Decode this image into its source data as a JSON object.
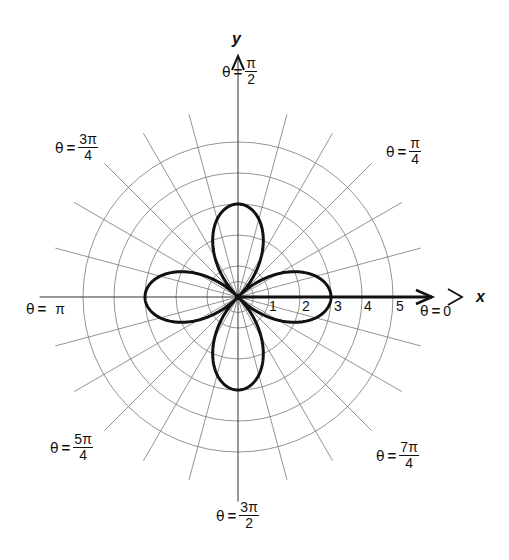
{
  "chart_data": {
    "type": "line",
    "subtype": "polar",
    "title": "",
    "curve": "four-leaved rose r = 3cos(2θ)",
    "equation": {
      "form": "r = a*cos(2*theta)",
      "a": 3
    },
    "petal_tips": [
      {
        "theta": "0",
        "r": 3
      },
      {
        "theta": "π/2",
        "r": 3
      },
      {
        "theta": "π",
        "r": 3
      },
      {
        "theta": "3π/2",
        "r": 3
      }
    ],
    "xlabel": "x",
    "ylabel": "y",
    "radial_ticks": [
      1,
      2,
      3,
      4,
      5
    ],
    "radial_range": [
      0,
      5
    ],
    "angular_gridline_step_deg": 15,
    "grid": true,
    "angle_labels": [
      {
        "key": "0",
        "theta_prefix": "θ",
        "eq": "=",
        "whole": "0"
      },
      {
        "key": "pi_over_4",
        "theta_prefix": "θ",
        "eq": "=",
        "num": "π",
        "den": "4"
      },
      {
        "key": "pi_over_2",
        "theta_prefix": "θ",
        "eq": "=",
        "num": "π",
        "den": "2"
      },
      {
        "key": "3pi_over_4",
        "theta_prefix": "θ",
        "eq": "=",
        "num": "3π",
        "den": "4"
      },
      {
        "key": "pi",
        "theta_prefix": "θ",
        "eq": "=",
        "whole": "π"
      },
      {
        "key": "5pi_over_4",
        "theta_prefix": "θ",
        "eq": "=",
        "num": "5π",
        "den": "4"
      },
      {
        "key": "3pi_over_2",
        "theta_prefix": "θ",
        "eq": "=",
        "num": "3π",
        "den": "2"
      },
      {
        "key": "7pi_over_4",
        "theta_prefix": "θ",
        "eq": "=",
        "num": "7π",
        "den": "4"
      }
    ],
    "legend": null
  },
  "layout": {
    "center": [
      238,
      297
    ],
    "unit_px": 31,
    "colors": {
      "grid": "#777777",
      "curve": "#111111",
      "axis": "#111111",
      "background": "#ffffff"
    }
  },
  "labels": {
    "x_axis": "x",
    "y_axis": "y",
    "ticks": [
      "1",
      "2",
      "3",
      "4",
      "5"
    ],
    "theta": "θ",
    "eq": "=",
    "a0": {
      "whole": "0"
    },
    "a45": {
      "num": "π",
      "den": "4"
    },
    "a90": {
      "num": "π",
      "den": "2"
    },
    "a135": {
      "num": "3π",
      "den": "4"
    },
    "a180": {
      "whole": "π"
    },
    "a225": {
      "num": "5π",
      "den": "4"
    },
    "a270": {
      "num": "3π",
      "den": "2"
    },
    "a315": {
      "num": "7π",
      "den": "4"
    }
  }
}
